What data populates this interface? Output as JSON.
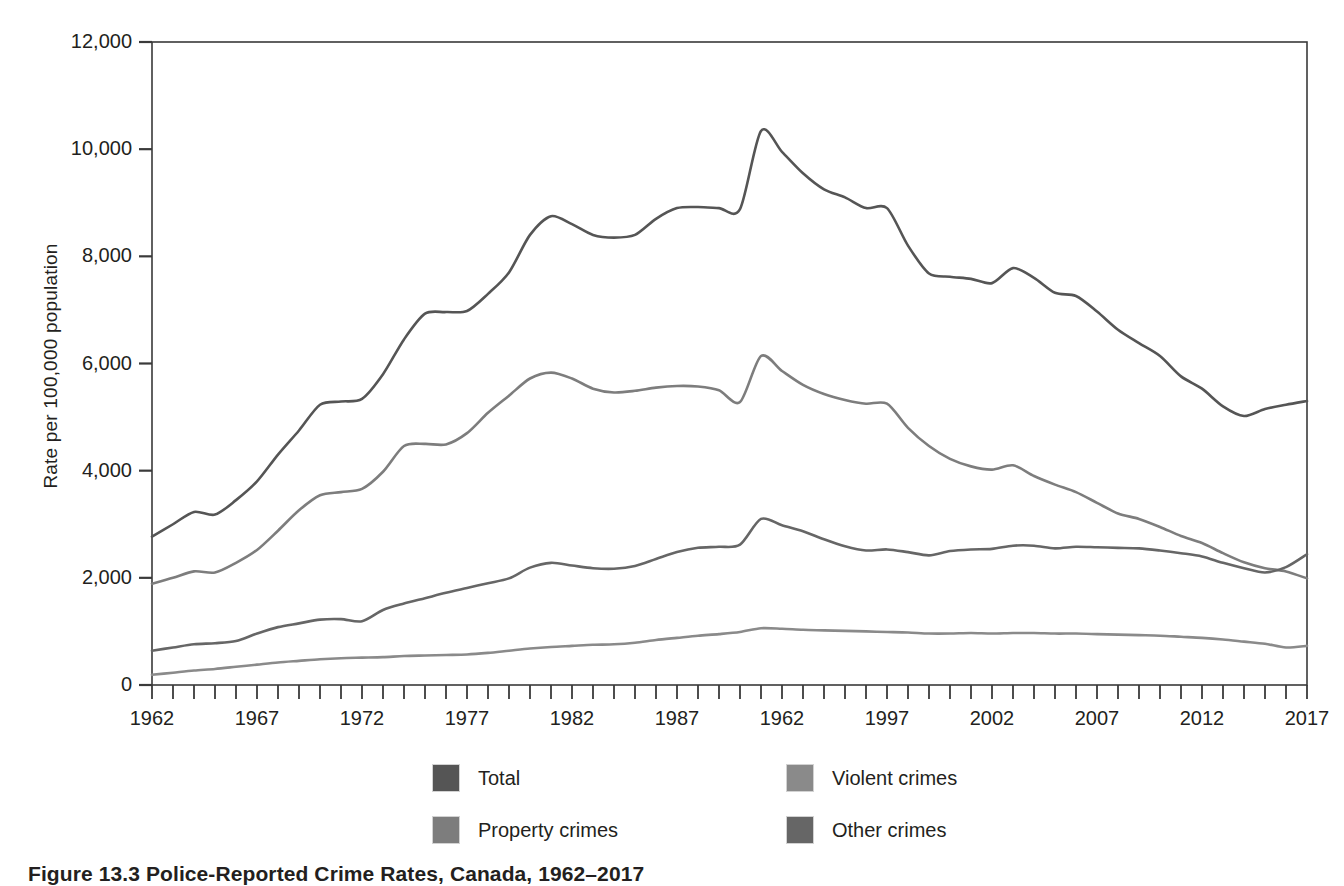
{
  "figure": {
    "caption": "Figure 13.3 Police-Reported Crime Rates, Canada, 1962–2017"
  },
  "axes": {
    "y_title": "Rate per 100,000 population",
    "y_ticks": [
      "0",
      "2,000",
      "4,000",
      "6,000",
      "8,000",
      "10,000",
      "12,000"
    ],
    "x_ticks": [
      "1962",
      "1967",
      "1972",
      "1977",
      "1982",
      "1987",
      "1962",
      "1997",
      "2002",
      "2007",
      "2012",
      "2017"
    ]
  },
  "legend": {
    "items": [
      {
        "label": "Total",
        "color": "#555555"
      },
      {
        "label": "Violent crimes",
        "color": "#8a8a8a"
      },
      {
        "label": "Property crimes",
        "color": "#7d7d7d"
      },
      {
        "label": "Other crimes",
        "color": "#666666"
      }
    ]
  },
  "chart_data": {
    "type": "line",
    "title": "Figure 13.3 Police-Reported Crime Rates, Canada, 1962–2017",
    "xlabel": "",
    "ylabel": "Rate per 100,000 population",
    "xlim": [
      1962,
      2017
    ],
    "ylim": [
      0,
      12000
    ],
    "ytick_step": 2000,
    "grid": false,
    "legend_position": "bottom",
    "x": [
      1962,
      1963,
      1964,
      1965,
      1966,
      1967,
      1968,
      1969,
      1970,
      1971,
      1972,
      1973,
      1974,
      1975,
      1976,
      1977,
      1978,
      1979,
      1980,
      1981,
      1982,
      1983,
      1984,
      1985,
      1986,
      1987,
      1988,
      1989,
      1990,
      1991,
      1992,
      1993,
      1994,
      1995,
      1996,
      1997,
      1998,
      1999,
      2000,
      2001,
      2002,
      2003,
      2004,
      2005,
      2006,
      2007,
      2008,
      2009,
      2010,
      2011,
      2012,
      2013,
      2014,
      2015,
      2016,
      2017
    ],
    "series": [
      {
        "name": "Total",
        "color": "#555555",
        "values": [
          2771,
          3000,
          3230,
          3180,
          3450,
          3800,
          4300,
          4750,
          5230,
          5290,
          5340,
          5800,
          6450,
          6930,
          6960,
          6980,
          7300,
          7700,
          8400,
          8750,
          8600,
          8400,
          8350,
          8400,
          8700,
          8900,
          8920,
          8900,
          8880,
          10340,
          9950,
          9550,
          9250,
          9100,
          8900,
          8900,
          8200,
          7680,
          7620,
          7580,
          7500,
          7780,
          7600,
          7320,
          7260,
          6970,
          6630,
          6380,
          6140,
          5760,
          5530,
          5200,
          5020,
          5150,
          5230,
          5300
        ]
      },
      {
        "name": "Property crimes",
        "color": "#7d7d7d",
        "values": [
          1891,
          2000,
          2120,
          2100,
          2280,
          2520,
          2880,
          3260,
          3540,
          3600,
          3660,
          3980,
          4460,
          4500,
          4490,
          4700,
          5080,
          5400,
          5720,
          5830,
          5720,
          5530,
          5460,
          5490,
          5550,
          5580,
          5570,
          5500,
          5280,
          6140,
          5860,
          5600,
          5430,
          5320,
          5250,
          5250,
          4800,
          4460,
          4220,
          4080,
          4020,
          4100,
          3900,
          3740,
          3600,
          3400,
          3200,
          3100,
          2950,
          2780,
          2650,
          2460,
          2290,
          2180,
          2120,
          1990
        ]
      },
      {
        "name": "Other crimes",
        "color": "#666666",
        "values": [
          640,
          700,
          760,
          780,
          820,
          960,
          1080,
          1150,
          1220,
          1230,
          1190,
          1400,
          1520,
          1620,
          1720,
          1810,
          1900,
          1990,
          2190,
          2280,
          2230,
          2180,
          2170,
          2220,
          2350,
          2480,
          2560,
          2580,
          2620,
          3100,
          2980,
          2870,
          2720,
          2590,
          2510,
          2530,
          2480,
          2420,
          2500,
          2530,
          2540,
          2600,
          2600,
          2550,
          2580,
          2570,
          2560,
          2550,
          2510,
          2460,
          2400,
          2280,
          2180,
          2100,
          2200,
          2440
        ]
      },
      {
        "name": "Violent crimes",
        "color": "#8a8a8a",
        "values": [
          190,
          230,
          270,
          300,
          340,
          380,
          420,
          450,
          480,
          500,
          510,
          520,
          540,
          550,
          560,
          570,
          600,
          640,
          680,
          710,
          730,
          750,
          760,
          790,
          840,
          880,
          920,
          950,
          990,
          1060,
          1050,
          1030,
          1020,
          1010,
          1000,
          990,
          980,
          960,
          960,
          970,
          960,
          970,
          970,
          960,
          960,
          950,
          940,
          930,
          920,
          900,
          880,
          850,
          810,
          770,
          700,
          730
        ]
      }
    ]
  }
}
